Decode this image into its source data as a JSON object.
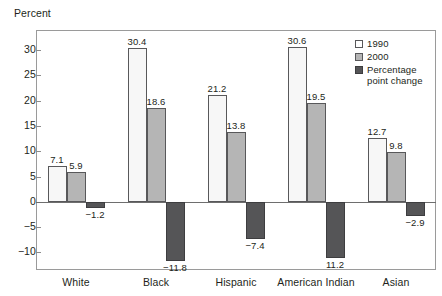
{
  "chart_data": {
    "type": "bar",
    "title": "",
    "subtitle": "",
    "xlabel": "",
    "ylabel": "Percent",
    "ylim": [
      -13.5,
      34
    ],
    "yticks": [
      30,
      25,
      20,
      15,
      10,
      5,
      0,
      -5,
      -10
    ],
    "ytick_labels": [
      "30",
      "25",
      "20",
      "15",
      "10",
      "5",
      "0",
      "−5",
      "−10"
    ],
    "grid": false,
    "legend_position": "top-right",
    "categories": [
      "White",
      "Black",
      "Hispanic",
      "American Indian",
      "Asian"
    ],
    "series": [
      {
        "name": "1990",
        "color": "#f7f7f7",
        "values": [
          7.1,
          30.4,
          21.2,
          30.6,
          12.7
        ],
        "labels": [
          "7.1",
          "30.4",
          "21.2",
          "30.6",
          "12.7"
        ]
      },
      {
        "name": "2000",
        "color": "#b5b5b5",
        "values": [
          5.9,
          18.6,
          13.8,
          19.5,
          9.8
        ],
        "labels": [
          "5.9",
          "18.6",
          "13.8",
          "19.5",
          "9.8"
        ]
      },
      {
        "name": "Percentage\npoint change",
        "color": "#555557",
        "values": [
          -1.2,
          -11.8,
          -7.4,
          -11.2,
          -2.9
        ],
        "labels": [
          "−1.2",
          "−11.8",
          "−7.4",
          "11.2",
          "−2.9"
        ]
      }
    ]
  },
  "axis": {
    "y_caption": "Percent"
  },
  "legend": {
    "items": [
      {
        "label": "1990",
        "swatch": "white-square-swatch"
      },
      {
        "label": "2000",
        "swatch": "light-gray-square-swatch"
      },
      {
        "label": "Percentage\npoint change",
        "swatch": "dark-gray-square-swatch"
      }
    ]
  }
}
